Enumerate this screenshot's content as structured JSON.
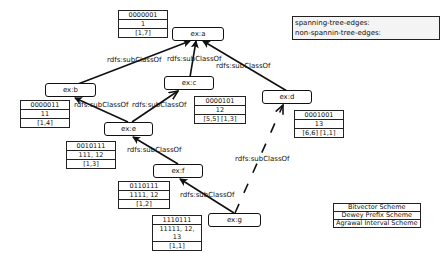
{
  "legend": {
    "spanning_label": "spanning-tree-edges:",
    "nonspanning_label": "non-spannin-tree-edges:"
  },
  "schemes": [
    "Bitvector Scheme",
    "Dewey Prefix Scheme",
    "Agrawal Interval Scheme"
  ],
  "edge_label": "rdfs:subClassOf",
  "nodes": {
    "a": {
      "label": "ex:a",
      "bitvector": "0000001",
      "dewey": "1",
      "interval": "[1,7]"
    },
    "b": {
      "label": "ex:b",
      "bitvector": "0000011",
      "dewey": "11",
      "interval": "[1,4]"
    },
    "c": {
      "label": "ex:c",
      "bitvector": "0000101",
      "dewey": "12",
      "interval": "[5,5] [1,3]"
    },
    "d": {
      "label": "ex:d",
      "bitvector": "0001001",
      "dewey": "13",
      "interval": "[6,6] [1,1]"
    },
    "e": {
      "label": "ex:e",
      "bitvector": "0010111",
      "dewey": "111, 12",
      "interval": "[1,3]"
    },
    "f": {
      "label": "ex:f",
      "bitvector": "0110111",
      "dewey": "1111, 12",
      "interval": "[1,2]"
    },
    "g": {
      "label": "ex:g",
      "bitvector": "1110111",
      "dewey": "11111, 12, 13",
      "interval": "[1,1]"
    }
  },
  "edges": [
    {
      "from": "b",
      "to": "a",
      "type": "spanning",
      "label": "rdfs:subClassOf"
    },
    {
      "from": "c",
      "to": "a",
      "type": "spanning",
      "label": "rdfs:subClassOf"
    },
    {
      "from": "d",
      "to": "a",
      "type": "spanning",
      "label": "rdfs:subClassOf"
    },
    {
      "from": "e",
      "to": "b",
      "type": "spanning",
      "label": "rdfs:subClassOf"
    },
    {
      "from": "e",
      "to": "c",
      "type": "non-spanning",
      "label": "rdfs:subClassOf"
    },
    {
      "from": "f",
      "to": "e",
      "type": "spanning",
      "label": "rdfs:subClassOf"
    },
    {
      "from": "g",
      "to": "f",
      "type": "spanning",
      "label": "rdfs:subClassOf"
    },
    {
      "from": "g",
      "to": "d",
      "type": "non-spanning",
      "label": "rdfs:subClassOf"
    }
  ]
}
